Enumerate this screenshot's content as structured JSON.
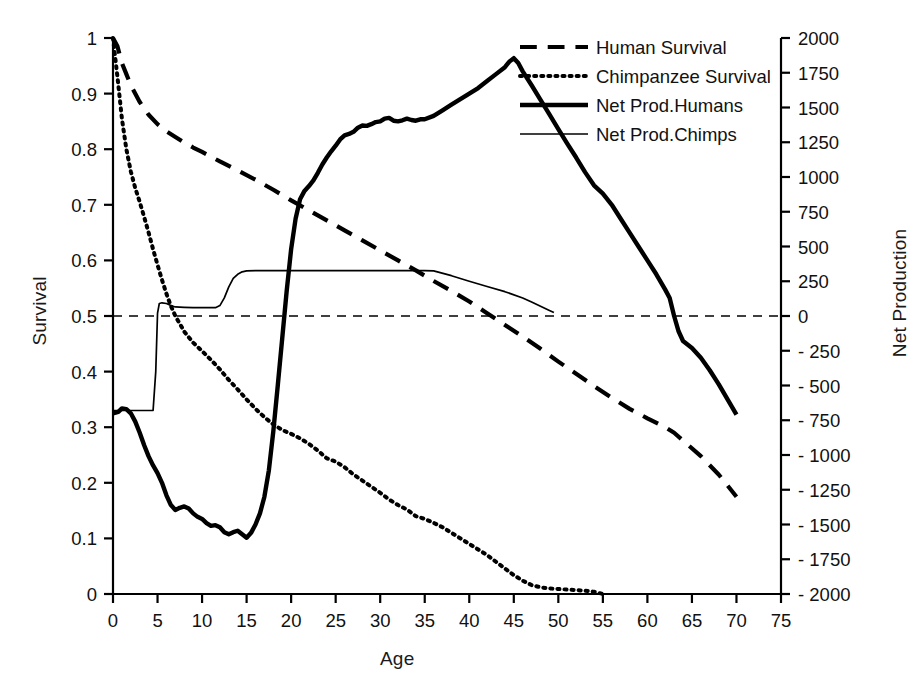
{
  "chart_data": {
    "type": "line",
    "title": "",
    "xlabel": "Age",
    "ylabel": "Survival",
    "ylabel_right": "Net Production",
    "xlim": [
      0,
      75
    ],
    "ylim": [
      0,
      1
    ],
    "ylim_right": [
      -2000,
      2000
    ],
    "grid": false,
    "legend_position": "top-center-right",
    "xticks": [
      "0",
      "5",
      "10",
      "15",
      "20",
      "25",
      "30",
      "35",
      "40",
      "45",
      "50",
      "55",
      "60",
      "65",
      "70",
      "75"
    ],
    "yticks_left": [
      "0",
      "0.1",
      "0.2",
      "0.3",
      "0.4",
      "0.5",
      "0.6",
      "0.7",
      "0.8",
      "0.9",
      "1"
    ],
    "yticks_right": [
      "2000",
      "1750",
      "1500",
      "1250",
      "1000",
      "750",
      "500",
      "250",
      "0",
      "- 250",
      "- 500",
      "- 750",
      "- 1000",
      "- 1250",
      "- 1500",
      "- 1750",
      "- 2000"
    ],
    "reference_line": {
      "label": "zero-net-production",
      "axis": "right",
      "value": 0,
      "style": "dashed"
    },
    "series": [
      {
        "name": "Human Survival",
        "axis": "left",
        "style": "dashed",
        "width": 4.2,
        "points": [
          [
            0,
            1.0
          ],
          [
            0.5,
            0.985
          ],
          [
            1,
            0.955
          ],
          [
            1.5,
            0.935
          ],
          [
            2,
            0.915
          ],
          [
            3,
            0.885
          ],
          [
            4,
            0.862
          ],
          [
            5,
            0.845
          ],
          [
            6,
            0.832
          ],
          [
            7,
            0.822
          ],
          [
            8,
            0.812
          ],
          [
            9,
            0.803
          ],
          [
            10,
            0.795
          ],
          [
            12,
            0.778
          ],
          [
            14,
            0.762
          ],
          [
            16,
            0.745
          ],
          [
            18,
            0.727
          ],
          [
            20,
            0.708
          ],
          [
            22,
            0.69
          ],
          [
            24,
            0.672
          ],
          [
            26,
            0.654
          ],
          [
            28,
            0.636
          ],
          [
            30,
            0.618
          ],
          [
            32,
            0.6
          ],
          [
            34,
            0.582
          ],
          [
            36,
            0.563
          ],
          [
            38,
            0.545
          ],
          [
            40,
            0.526
          ],
          [
            42,
            0.505
          ],
          [
            44,
            0.484
          ],
          [
            46,
            0.463
          ],
          [
            48,
            0.441
          ],
          [
            50,
            0.418
          ],
          [
            52,
            0.396
          ],
          [
            54,
            0.374
          ],
          [
            56,
            0.353
          ],
          [
            58,
            0.333
          ],
          [
            60,
            0.316
          ],
          [
            62,
            0.3
          ],
          [
            63,
            0.29
          ],
          [
            64,
            0.276
          ],
          [
            66,
            0.248
          ],
          [
            68,
            0.215
          ],
          [
            69,
            0.195
          ],
          [
            70,
            0.175
          ]
        ]
      },
      {
        "name": "Chimpanzee Survival",
        "axis": "left",
        "style": "dotted",
        "width": 4.0,
        "points": [
          [
            0,
            1.0
          ],
          [
            0.5,
            0.93
          ],
          [
            1,
            0.855
          ],
          [
            1.5,
            0.8
          ],
          [
            2,
            0.76
          ],
          [
            2.5,
            0.73
          ],
          [
            3,
            0.705
          ],
          [
            3.5,
            0.678
          ],
          [
            4,
            0.65
          ],
          [
            4.5,
            0.62
          ],
          [
            5,
            0.592
          ],
          [
            5.5,
            0.565
          ],
          [
            6,
            0.54
          ],
          [
            6.5,
            0.518
          ],
          [
            7,
            0.5
          ],
          [
            8,
            0.472
          ],
          [
            9,
            0.452
          ],
          [
            10,
            0.437
          ],
          [
            11,
            0.421
          ],
          [
            12,
            0.404
          ],
          [
            13,
            0.385
          ],
          [
            14,
            0.368
          ],
          [
            15,
            0.35
          ],
          [
            16,
            0.333
          ],
          [
            17,
            0.318
          ],
          [
            18,
            0.305
          ],
          [
            19,
            0.295
          ],
          [
            20,
            0.288
          ],
          [
            21,
            0.28
          ],
          [
            22,
            0.27
          ],
          [
            23,
            0.258
          ],
          [
            24,
            0.244
          ],
          [
            25,
            0.238
          ],
          [
            26,
            0.228
          ],
          [
            27,
            0.215
          ],
          [
            28,
            0.204
          ],
          [
            29,
            0.193
          ],
          [
            30,
            0.182
          ],
          [
            31,
            0.17
          ],
          [
            32,
            0.16
          ],
          [
            33,
            0.152
          ],
          [
            34,
            0.14
          ],
          [
            35,
            0.135
          ],
          [
            36,
            0.128
          ],
          [
            37,
            0.12
          ],
          [
            38,
            0.11
          ],
          [
            39,
            0.1
          ],
          [
            40,
            0.09
          ],
          [
            41,
            0.08
          ],
          [
            42,
            0.07
          ],
          [
            43,
            0.058
          ],
          [
            44,
            0.046
          ],
          [
            45,
            0.034
          ],
          [
            46,
            0.024
          ],
          [
            47,
            0.016
          ],
          [
            48,
            0.012
          ],
          [
            49,
            0.01
          ],
          [
            50,
            0.009
          ],
          [
            51,
            0.008
          ],
          [
            52,
            0.007
          ],
          [
            53,
            0.006
          ],
          [
            54,
            0.004
          ],
          [
            55,
            0.0
          ]
        ]
      },
      {
        "name": "Net Prod.Humans",
        "axis": "right",
        "style": "solid",
        "width": 4.4,
        "points": [
          [
            0,
            -700
          ],
          [
            0.6,
            -690
          ],
          [
            1,
            -665
          ],
          [
            1.5,
            -670
          ],
          [
            2,
            -700
          ],
          [
            2.5,
            -760
          ],
          [
            3,
            -840
          ],
          [
            3.5,
            -930
          ],
          [
            4,
            -1010
          ],
          [
            4.5,
            -1075
          ],
          [
            5,
            -1130
          ],
          [
            5.5,
            -1200
          ],
          [
            6,
            -1290
          ],
          [
            6.5,
            -1360
          ],
          [
            7,
            -1395
          ],
          [
            7.5,
            -1380
          ],
          [
            8,
            -1370
          ],
          [
            8.5,
            -1385
          ],
          [
            9,
            -1420
          ],
          [
            9.5,
            -1445
          ],
          [
            10,
            -1460
          ],
          [
            10.5,
            -1490
          ],
          [
            11,
            -1510
          ],
          [
            11.5,
            -1505
          ],
          [
            12,
            -1520
          ],
          [
            12.5,
            -1555
          ],
          [
            13,
            -1570
          ],
          [
            13.5,
            -1555
          ],
          [
            14,
            -1545
          ],
          [
            14.5,
            -1570
          ],
          [
            15,
            -1595
          ],
          [
            15.5,
            -1560
          ],
          [
            16,
            -1500
          ],
          [
            16.5,
            -1420
          ],
          [
            17,
            -1300
          ],
          [
            17.5,
            -1110
          ],
          [
            18,
            -830
          ],
          [
            18.5,
            -500
          ],
          [
            19,
            -160
          ],
          [
            19.5,
            180
          ],
          [
            20,
            480
          ],
          [
            20.5,
            700
          ],
          [
            21,
            840
          ],
          [
            21.5,
            900
          ],
          [
            22,
            935
          ],
          [
            22.5,
            975
          ],
          [
            23,
            1030
          ],
          [
            23.5,
            1090
          ],
          [
            24,
            1140
          ],
          [
            24.5,
            1185
          ],
          [
            25,
            1225
          ],
          [
            25.5,
            1270
          ],
          [
            26,
            1300
          ],
          [
            26.5,
            1310
          ],
          [
            27,
            1325
          ],
          [
            27.5,
            1355
          ],
          [
            28,
            1370
          ],
          [
            28.5,
            1368
          ],
          [
            29,
            1380
          ],
          [
            29.5,
            1395
          ],
          [
            30,
            1400
          ],
          [
            30.5,
            1420
          ],
          [
            31,
            1425
          ],
          [
            31.5,
            1405
          ],
          [
            32,
            1400
          ],
          [
            32.5,
            1408
          ],
          [
            33,
            1420
          ],
          [
            33.5,
            1410
          ],
          [
            34,
            1405
          ],
          [
            34.5,
            1415
          ],
          [
            35,
            1415
          ],
          [
            36,
            1440
          ],
          [
            37,
            1480
          ],
          [
            38,
            1520
          ],
          [
            39,
            1560
          ],
          [
            40,
            1600
          ],
          [
            41,
            1640
          ],
          [
            42,
            1690
          ],
          [
            43,
            1740
          ],
          [
            44,
            1790
          ],
          [
            44.5,
            1830
          ],
          [
            45,
            1855
          ],
          [
            45.5,
            1820
          ],
          [
            46,
            1760
          ],
          [
            47,
            1660
          ],
          [
            48,
            1555
          ],
          [
            49,
            1450
          ],
          [
            50,
            1345
          ],
          [
            51,
            1240
          ],
          [
            52,
            1140
          ],
          [
            53,
            1035
          ],
          [
            54,
            940
          ],
          [
            55,
            880
          ],
          [
            56,
            800
          ],
          [
            57,
            700
          ],
          [
            58,
            600
          ],
          [
            59,
            500
          ],
          [
            60,
            400
          ],
          [
            61,
            300
          ],
          [
            62,
            190
          ],
          [
            62.5,
            130
          ],
          [
            63,
            0
          ],
          [
            63.5,
            -110
          ],
          [
            64,
            -180
          ],
          [
            65,
            -230
          ],
          [
            66,
            -300
          ],
          [
            67,
            -390
          ],
          [
            68,
            -490
          ],
          [
            69,
            -600
          ],
          [
            70,
            -710
          ]
        ]
      },
      {
        "name": "Net Prod.Chimps",
        "axis": "right",
        "style": "solid-thin",
        "width": 1.7,
        "points": [
          [
            0,
            -680
          ],
          [
            1,
            -680
          ],
          [
            2,
            -680
          ],
          [
            3,
            -680
          ],
          [
            4,
            -680
          ],
          [
            4.5,
            -680
          ],
          [
            4.8,
            -400
          ],
          [
            5.0,
            20
          ],
          [
            5.2,
            90
          ],
          [
            5.5,
            95
          ],
          [
            6,
            90
          ],
          [
            6.5,
            75
          ],
          [
            7,
            65
          ],
          [
            8,
            62
          ],
          [
            9,
            60
          ],
          [
            10,
            60
          ],
          [
            11,
            60
          ],
          [
            11.5,
            60
          ],
          [
            12,
            75
          ],
          [
            12.5,
            130
          ],
          [
            13,
            210
          ],
          [
            13.5,
            270
          ],
          [
            14,
            300
          ],
          [
            14.5,
            318
          ],
          [
            15,
            325
          ],
          [
            16,
            327
          ],
          [
            18,
            327
          ],
          [
            20,
            327
          ],
          [
            24,
            327
          ],
          [
            28,
            327
          ],
          [
            32,
            327
          ],
          [
            35,
            327
          ],
          [
            36,
            325
          ],
          [
            38,
            290
          ],
          [
            40,
            250
          ],
          [
            42,
            212
          ],
          [
            44,
            175
          ],
          [
            46,
            130
          ],
          [
            47,
            100
          ],
          [
            48,
            70
          ],
          [
            49,
            40
          ],
          [
            49.5,
            25
          ]
        ]
      }
    ]
  },
  "legend": {
    "items": [
      {
        "label": "Human Survival",
        "style": "dashed"
      },
      {
        "label": "Chimpanzee Survival",
        "style": "dotted"
      },
      {
        "label": "Net Prod.Humans",
        "style": "solid"
      },
      {
        "label": "Net Prod.Chimps",
        "style": "solid-thin"
      }
    ]
  },
  "colors": {
    "ink": "#000000",
    "background": "#ffffff"
  }
}
